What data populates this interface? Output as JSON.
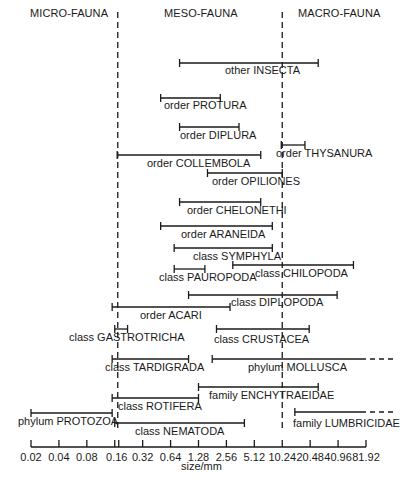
{
  "headers": {
    "micro": "MICRO-FAUNA",
    "meso": "MESO-FAUNA",
    "macro": "MACRO-FAUNA"
  },
  "axis": {
    "label": "size/mm",
    "ticks": [
      "0.02",
      "0.04",
      "0.08",
      "0.16",
      "0.32",
      "0.64",
      "1.28",
      "2.56",
      "5.12",
      "10.24",
      "20.48",
      "40.96",
      "81.92"
    ]
  },
  "boundaries": {
    "micro_meso_mm": 0.16,
    "meso_macro_mm": 10.24
  },
  "colors": {
    "ink": "#1a1a1a",
    "background": "#ffffff"
  },
  "chart_data": {
    "type": "range-bar",
    "title": "",
    "xlabel": "size/mm",
    "xscale": "log2",
    "xlim": [
      0.02,
      81.92
    ],
    "regions": [
      {
        "name": "MICRO-FAUNA",
        "range": [
          0.02,
          0.16
        ]
      },
      {
        "name": "MESO-FAUNA",
        "range": [
          0.16,
          10.24
        ]
      },
      {
        "name": "MACRO-FAUNA",
        "range": [
          10.24,
          81.92
        ]
      }
    ],
    "groups": [
      {
        "label": "other INSECTA",
        "min": 0.8,
        "max": 25,
        "y": 63,
        "lx": 225,
        "ly": 66
      },
      {
        "label": "order PROTURA",
        "min": 0.5,
        "max": 2.2,
        "y": 98,
        "lx": 164,
        "ly": 101
      },
      {
        "label": "order DIPLURA",
        "min": 0.8,
        "max": 3.5,
        "y": 127,
        "lx": 180,
        "ly": 131
      },
      {
        "label": "order THYSANURA",
        "min": 10,
        "max": 18,
        "y": 145,
        "lx": 276,
        "ly": 149
      },
      {
        "label": "order COLLEMBOLA",
        "min": 0.17,
        "max": 6,
        "y": 155,
        "lx": 147,
        "ly": 159
      },
      {
        "label": "order OPILIONES",
        "min": 1.6,
        "max": 10.24,
        "y": 173,
        "lx": 212,
        "ly": 177
      },
      {
        "label": "order CHELONETHI",
        "min": 0.8,
        "max": 6,
        "y": 202,
        "lx": 187,
        "ly": 206
      },
      {
        "label": "order ARANEIDA",
        "min": 0.5,
        "max": 8,
        "y": 226,
        "lx": 181,
        "ly": 230
      },
      {
        "label": "class SYMPHYLA",
        "min": 0.7,
        "max": 8,
        "y": 248,
        "lx": 193,
        "ly": 252
      },
      {
        "label": "class CHILOPODA",
        "min": 3,
        "max": 60,
        "y": 265,
        "lx": 255,
        "ly": 269
      },
      {
        "label": "class PAUROPODA",
        "min": 0.7,
        "max": 1.5,
        "y": 269,
        "lx": 159,
        "ly": 273
      },
      {
        "label": "class DIPLOPODA",
        "min": 1.0,
        "max": 40,
        "y": 295,
        "lx": 231,
        "ly": 298
      },
      {
        "label": "order ACARI",
        "min": 0.15,
        "max": 2.8,
        "y": 307,
        "lx": 140,
        "ly": 311
      },
      {
        "label": "class GASTROTRICHA",
        "min": 0.16,
        "max": 0.22,
        "y": 329,
        "lx": 69,
        "ly": 333
      },
      {
        "label": "class CRUSTACEA",
        "min": 2.0,
        "max": 20,
        "y": 329,
        "lx": 214,
        "ly": 335
      },
      {
        "label": "class TARDIGRADA",
        "min": 0.15,
        "max": 1.0,
        "y": 359,
        "lx": 105,
        "ly": 363
      },
      {
        "label": "phylum MOLLUSCA",
        "min": 1.8,
        "max": 81.92,
        "extends": true,
        "y": 359,
        "lx": 248,
        "ly": 363
      },
      {
        "label": "family ENCHYTRAEIDAE",
        "min": 1.28,
        "max": 25,
        "y": 387,
        "lx": 209,
        "ly": 391
      },
      {
        "label": "class ROTIFERA",
        "min": 0.15,
        "max": 1.28,
        "y": 398,
        "lx": 118,
        "ly": 402
      },
      {
        "label": "phylum PROTOZOA",
        "min": 0.02,
        "max": 0.15,
        "y": 413,
        "lx": 18,
        "ly": 417
      },
      {
        "label": "class NEMATODA",
        "min": 0.16,
        "max": 4.0,
        "y": 423,
        "lx": 135,
        "ly": 427
      },
      {
        "label": "family LUMBRICIDAE",
        "min": 14,
        "max": 81.92,
        "extends": true,
        "y": 412,
        "lx": 293,
        "ly": 419
      }
    ]
  }
}
